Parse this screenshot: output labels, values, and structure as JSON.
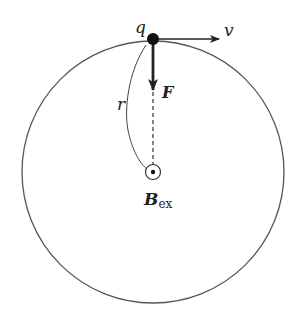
{
  "diagram": {
    "labels": {
      "charge": "q",
      "velocity": "v",
      "force": "F",
      "radius": "r",
      "field": "B",
      "field_subscript": "ex"
    },
    "colors": {
      "stroke": "#555555",
      "arrow": "#222222",
      "background": "#ffffff"
    }
  }
}
